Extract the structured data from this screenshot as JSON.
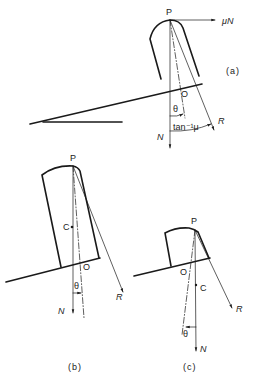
{
  "figure": {
    "panels": [
      {
        "id": "a",
        "caption": "(a)",
        "labels": {
          "top_point": "P",
          "pivot": "O",
          "friction_force": "μN",
          "normal": "N",
          "resultant": "R",
          "angle_theta": "θ",
          "angle_friction": "tan⁻¹μ"
        }
      },
      {
        "id": "b",
        "caption": "(b)",
        "labels": {
          "top_point": "P",
          "centroid": "C",
          "pivot": "O",
          "normal": "N",
          "resultant": "R",
          "angle_theta": "θ"
        }
      },
      {
        "id": "c",
        "caption": "(c)",
        "labels": {
          "top_point": "P",
          "centroid": "C",
          "pivot": "O",
          "normal": "N",
          "resultant": "R",
          "angle_theta": "θ"
        }
      }
    ],
    "colors": {
      "ink": "#1a1a1a",
      "background": "#ffffff"
    }
  }
}
